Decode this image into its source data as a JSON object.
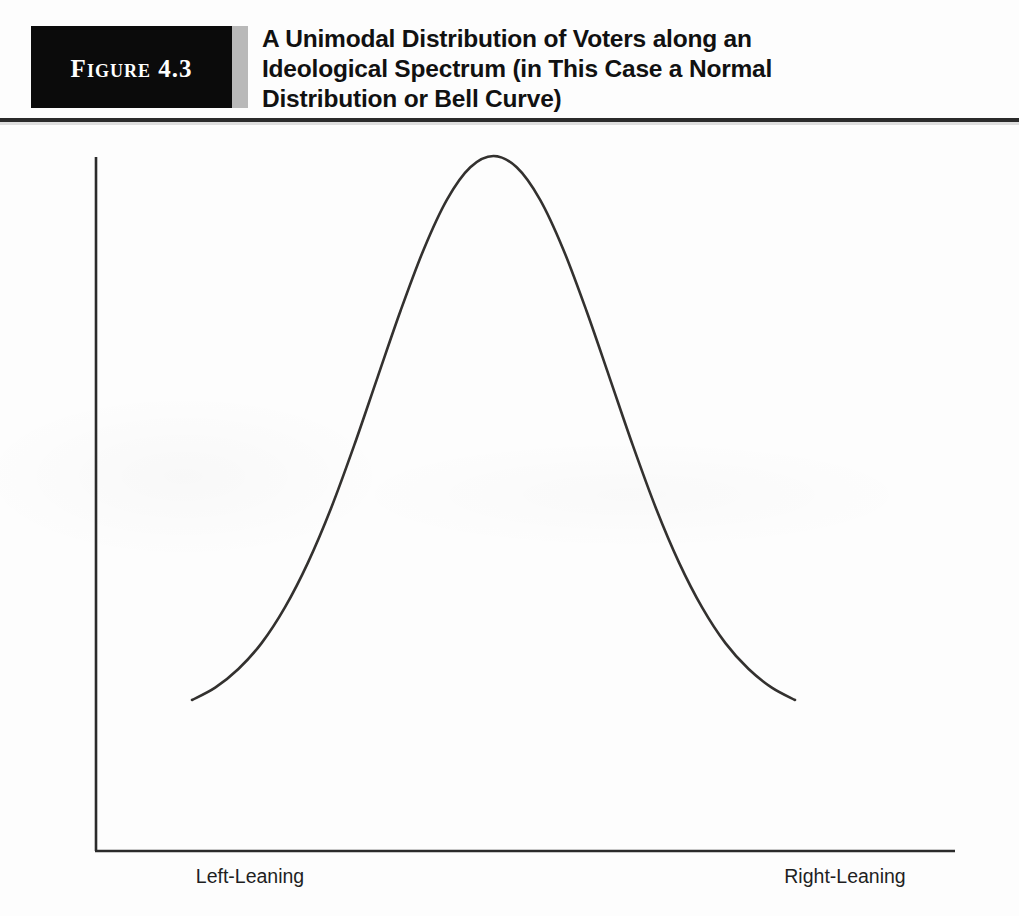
{
  "figure": {
    "badge_label": "Figure 4.3",
    "title_lines": [
      "A Unimodal Distribution of Voters along an",
      "Ideological Spectrum (in This Case a Normal",
      "Distribution or Bell Curve)"
    ],
    "title_full": "A Unimodal Distribution of Voters along an Ideological Spectrum (in This Case a Normal Distribution or Bell Curve)"
  },
  "colors": {
    "badge_background": "#0b0b0b",
    "badge_text": "#ffffff",
    "badge_bar": "#b9b9b9",
    "rule": "#2b2b2b",
    "axis": "#2b2b2b",
    "curve": "#33312f",
    "page_background": "#fdfdfd",
    "text": "#1f1f1f"
  },
  "chart_data": {
    "type": "line",
    "title": "A Unimodal Distribution of Voters along an Ideological Spectrum (in This Case a Normal Distribution or Bell Curve)",
    "xlabel": "",
    "ylabel": "Number of Voters",
    "xtick_labels": [
      "Left-Leaning",
      "Right-Leaning"
    ],
    "ytick_labels": [],
    "grid": false,
    "legend": false,
    "xlim": [
      -3,
      3
    ],
    "ylim": [
      0,
      1.12
    ],
    "distribution": "normal",
    "mean": 0,
    "std_dev": 1,
    "peak": {
      "x": 0,
      "y": 1.0
    },
    "x": [
      -2.6,
      -2.4,
      -2.2,
      -2.0,
      -1.8,
      -1.6,
      -1.4,
      -1.2,
      -1.0,
      -0.8,
      -0.6,
      -0.4,
      -0.2,
      0.0,
      0.2,
      0.4,
      0.6,
      0.8,
      1.0,
      1.2,
      1.4,
      1.6,
      1.8,
      2.0,
      2.2,
      2.4,
      2.6
    ],
    "y": [
      0.034,
      0.056,
      0.089,
      0.135,
      0.198,
      0.278,
      0.375,
      0.487,
      0.607,
      0.726,
      0.835,
      0.923,
      0.98,
      1.0,
      0.98,
      0.923,
      0.835,
      0.726,
      0.607,
      0.487,
      0.375,
      0.278,
      0.198,
      0.135,
      0.089,
      0.056,
      0.034
    ],
    "series": [
      {
        "name": "Number of Voters",
        "y": [
          0.034,
          0.056,
          0.089,
          0.135,
          0.198,
          0.278,
          0.375,
          0.487,
          0.607,
          0.726,
          0.835,
          0.923,
          0.98,
          1.0,
          0.98,
          0.923,
          0.835,
          0.726,
          0.607,
          0.487,
          0.375,
          0.278,
          0.198,
          0.135,
          0.089,
          0.056,
          0.034
        ]
      }
    ]
  }
}
